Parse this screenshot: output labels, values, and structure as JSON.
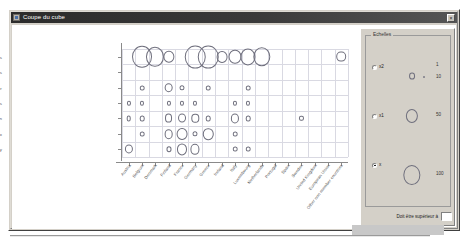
{
  "window": {
    "title": "Coupe du cube",
    "icon": "window-app-icon",
    "close_label": "×"
  },
  "chart_data": {
    "type": "scatter",
    "title": "",
    "xlabel": "",
    "ylabel": "",
    "grid": true,
    "bubble_scale_note": "Circle area encodes magnitude",
    "categories_y": [
      "Foreign trade indices",
      "Indices of new orders",
      "Indices of turnover",
      "Productivity indices",
      "Production",
      "Sectoral producer price index",
      "Social indicators in industry"
    ],
    "categories_x": [
      "Austria",
      "Belgium",
      "Denmark",
      "Finland",
      "France",
      "Germany",
      "Greece",
      "Ireland",
      "Italy",
      "Luxembourg",
      "Netherlands",
      "Portugal",
      "Spain",
      "Sweden",
      "United Kingdom",
      "European Union",
      "Other non member countries"
    ],
    "points": [
      {
        "x": 1,
        "y": 0,
        "v": 95
      },
      {
        "x": 2,
        "y": 0,
        "v": 78
      },
      {
        "x": 3,
        "y": 0,
        "v": 30
      },
      {
        "x": 5,
        "y": 0,
        "v": 100
      },
      {
        "x": 6,
        "y": 0,
        "v": 100
      },
      {
        "x": 7,
        "y": 0,
        "v": 28
      },
      {
        "x": 8,
        "y": 0,
        "v": 40
      },
      {
        "x": 9,
        "y": 0,
        "v": 55
      },
      {
        "x": 10,
        "y": 0,
        "v": 72
      },
      {
        "x": 16,
        "y": 0,
        "v": 22
      },
      {
        "x": 1,
        "y": 2,
        "v": 5
      },
      {
        "x": 3,
        "y": 2,
        "v": 18
      },
      {
        "x": 4,
        "y": 2,
        "v": 6
      },
      {
        "x": 6,
        "y": 2,
        "v": 5
      },
      {
        "x": 9,
        "y": 2,
        "v": 5
      },
      {
        "x": 0,
        "y": 3,
        "v": 4
      },
      {
        "x": 1,
        "y": 3,
        "v": 4
      },
      {
        "x": 3,
        "y": 3,
        "v": 4
      },
      {
        "x": 4,
        "y": 3,
        "v": 4
      },
      {
        "x": 5,
        "y": 3,
        "v": 4
      },
      {
        "x": 8,
        "y": 3,
        "v": 4
      },
      {
        "x": 9,
        "y": 3,
        "v": 4
      },
      {
        "x": 0,
        "y": 4,
        "v": 5
      },
      {
        "x": 1,
        "y": 4,
        "v": 5
      },
      {
        "x": 3,
        "y": 4,
        "v": 15
      },
      {
        "x": 4,
        "y": 4,
        "v": 15
      },
      {
        "x": 5,
        "y": 4,
        "v": 13
      },
      {
        "x": 6,
        "y": 4,
        "v": 5
      },
      {
        "x": 8,
        "y": 4,
        "v": 16
      },
      {
        "x": 9,
        "y": 4,
        "v": 5
      },
      {
        "x": 13,
        "y": 4,
        "v": 4
      },
      {
        "x": 1,
        "y": 5,
        "v": 5
      },
      {
        "x": 3,
        "y": 5,
        "v": 18
      },
      {
        "x": 4,
        "y": 5,
        "v": 28
      },
      {
        "x": 5,
        "y": 5,
        "v": 6
      },
      {
        "x": 6,
        "y": 5,
        "v": 26
      },
      {
        "x": 8,
        "y": 5,
        "v": 5
      },
      {
        "x": 0,
        "y": 6,
        "v": 16
      },
      {
        "x": 3,
        "y": 6,
        "v": 6
      },
      {
        "x": 4,
        "y": 6,
        "v": 24
      },
      {
        "x": 5,
        "y": 6,
        "v": 20
      },
      {
        "x": 8,
        "y": 6,
        "v": 5
      },
      {
        "x": 9,
        "y": 6,
        "v": 5
      }
    ]
  },
  "panel": {
    "group_title": "Echelles",
    "options": [
      {
        "id": "x2",
        "label": "x2",
        "checked": false
      },
      {
        "id": "x1",
        "label": "x1",
        "checked": false
      },
      {
        "id": "x",
        "label": "x",
        "checked": true
      }
    ],
    "legend": [
      {
        "value": "1",
        "size": 0
      },
      {
        "value": "10",
        "size": 3
      },
      {
        "value": "50",
        "size": 13
      },
      {
        "value": "100",
        "size": 26
      }
    ],
    "filter": {
      "label": "Doit être supérieur à",
      "value": ""
    }
  }
}
